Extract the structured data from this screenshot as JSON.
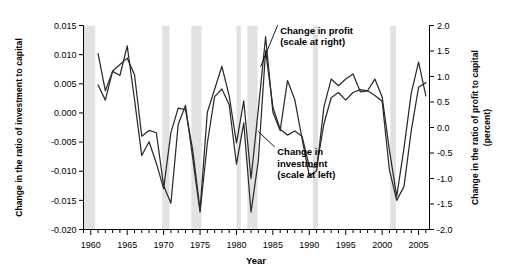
{
  "chart_data": {
    "type": "line",
    "title": "",
    "xlabel": "Year",
    "ylabel_left": "Change in the ratio of investment to capital",
    "ylabel_right_line1": "Change in the ratio of profit to capital",
    "ylabel_right_line2": "(percent)",
    "xlim": [
      1959.0,
      2006.5
    ],
    "ylim_left": [
      -0.02,
      0.015
    ],
    "ylim_right": [
      -2.0,
      2.0
    ],
    "grid": false,
    "legend_position": "inline-annotations",
    "xticks_labeled": [
      1960,
      1965,
      1970,
      1975,
      1980,
      1985,
      1990,
      1995,
      2000,
      2005
    ],
    "xtick_minor_step": 1,
    "yticks_left": [
      0.015,
      0.01,
      0.005,
      0.0,
      -0.005,
      -0.01,
      -0.015,
      -0.02
    ],
    "yticks_left_labels": [
      "0.015",
      "0.010",
      "0.005",
      "0.000",
      "-0.005",
      "-0.010",
      "-0.015",
      "-0.020"
    ],
    "yticks_right": [
      2.0,
      1.5,
      1.0,
      0.5,
      0.0,
      -0.5,
      -1.0,
      -1.5,
      -2.0
    ],
    "yticks_right_labels": [
      "2.0",
      "1.5",
      "1.0",
      "0.5",
      "0.0",
      "-0.5",
      "-1.0",
      "-1.5",
      "-2.0"
    ],
    "annotations": [
      {
        "name": "profit-annotation",
        "text_line1": "Change in profit",
        "text_line2": "(scale at right)",
        "x": 1986.0,
        "y_top": 0.0136,
        "leader_to_x": 1983.3,
        "leader_to_y": 0.0079
      },
      {
        "name": "investment-annotation",
        "text_line1": "Change in",
        "text_line2": "investment",
        "text_line3": "(scale at left)",
        "x": 1985.6,
        "y_top": -0.0073,
        "leader_to_x": 1983.0,
        "leader_to_y": -0.0032
      }
    ],
    "recession_bands": [
      {
        "start": 1959.0,
        "end": 1960.6
      },
      {
        "start": 1969.8,
        "end": 1970.8
      },
      {
        "start": 1973.8,
        "end": 1975.2
      },
      {
        "start": 1980.0,
        "end": 1980.6
      },
      {
        "start": 1981.5,
        "end": 1982.9
      },
      {
        "start": 1990.5,
        "end": 1991.2
      },
      {
        "start": 2001.1,
        "end": 2001.9
      }
    ],
    "band_color": "#e2e2e2",
    "line_color": "#2b2b2b",
    "series": [
      {
        "name": "Change in investment",
        "scale": "left",
        "axis_units": "ratio",
        "x": [
          1961,
          1962,
          1963,
          1964,
          1965,
          1966,
          1967,
          1968,
          1969,
          1970,
          1971,
          1972,
          1973,
          1974,
          1975,
          1976,
          1977,
          1978,
          1979,
          1980,
          1981,
          1982,
          1983,
          1984,
          1985,
          1986,
          1987,
          1988,
          1989,
          1990,
          1991,
          1992,
          1993,
          1994,
          1995,
          1996,
          1997,
          1998,
          1999,
          2000,
          2001,
          2002,
          2003,
          2004,
          2005,
          2006
        ],
        "values": [
          0.0048,
          0.0022,
          0.0072,
          0.0083,
          0.0094,
          0.0066,
          -0.004,
          -0.003,
          -0.0034,
          -0.0125,
          -0.0155,
          -0.002,
          0.0013,
          -0.0078,
          -0.017,
          -0.0052,
          0.0028,
          0.0041,
          0.0014,
          -0.0088,
          -0.0017,
          -0.017,
          -0.0082,
          0.0107,
          0.001,
          -0.0028,
          -0.0038,
          -0.0031,
          -0.004,
          -0.0092,
          -0.0093,
          -0.0019,
          0.0026,
          0.0035,
          0.0022,
          0.0035,
          0.004,
          0.0038,
          0.003,
          0.002,
          -0.0098,
          -0.015,
          -0.0126,
          -0.003,
          0.0044,
          0.0052
        ]
      },
      {
        "name": "Change in profit",
        "scale": "right",
        "axis_units": "percent",
        "x": [
          1961,
          1962,
          1963,
          1964,
          1965,
          1966,
          1967,
          1968,
          1969,
          1970,
          1971,
          1972,
          1973,
          1974,
          1975,
          1976,
          1977,
          1978,
          1979,
          1980,
          1981,
          1982,
          1983,
          1984,
          1985,
          1986,
          1987,
          1988,
          1989,
          1990,
          1991,
          1992,
          1993,
          1994,
          1995,
          1996,
          1997,
          1998,
          1999,
          2000,
          2001,
          2002,
          2003,
          2004,
          2005,
          2006
        ],
        "values": [
          1.45,
          0.72,
          1.1,
          1.02,
          1.6,
          0.55,
          -0.55,
          -0.28,
          -0.7,
          -1.2,
          -0.1,
          0.38,
          0.35,
          -0.45,
          -1.62,
          0.3,
          0.75,
          1.2,
          0.62,
          -0.3,
          0.52,
          -1.0,
          0.35,
          1.78,
          0.3,
          -0.06,
          0.92,
          0.55,
          -0.22,
          -0.95,
          -0.85,
          0.4,
          0.95,
          0.82,
          0.95,
          1.05,
          0.7,
          0.72,
          0.95,
          0.6,
          -0.45,
          -1.35,
          -0.4,
          0.68,
          1.28,
          0.62
        ]
      }
    ]
  }
}
